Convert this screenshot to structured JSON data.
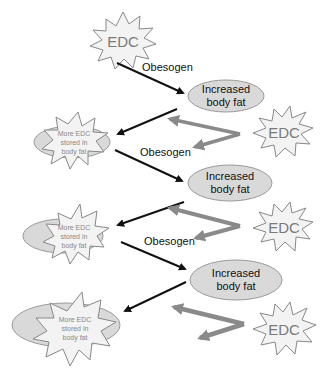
{
  "diagram": {
    "title": "",
    "colors": {
      "black_arrow": "#111111",
      "gray_arrow": "#8a8a8a",
      "ellipse_fill": "#d9d9d9",
      "ellipse_stroke": "#9a9a9a",
      "star_fill": "#f3f3f3",
      "star_stroke": "#888888",
      "edc_text": "#7a7a7a"
    },
    "top_edc": {
      "label": "EDC"
    },
    "stages": [
      {
        "obesogen_label": "Obesogen",
        "increased": {
          "line1": "Increased",
          "line2": "body fat"
        },
        "edc": {
          "label": "EDC"
        },
        "stored": {
          "line1": "More EDC",
          "line2": "stored in",
          "line3": "body fat"
        }
      },
      {
        "obesogen_label": "Obesogen",
        "increased": {
          "line1": "Increased",
          "line2": "body fat"
        },
        "edc": {
          "label": "EDC"
        },
        "stored": {
          "line1": "More EDC",
          "line2": "stored in",
          "line3": "body fat"
        }
      },
      {
        "obesogen_label": "Obesogen",
        "increased": {
          "line1": "Increased",
          "line2": "body fat"
        },
        "edc": {
          "label": "EDC"
        },
        "stored": {
          "line1": "More EDC",
          "line2": "stored in",
          "line3": "body fat"
        }
      }
    ]
  }
}
